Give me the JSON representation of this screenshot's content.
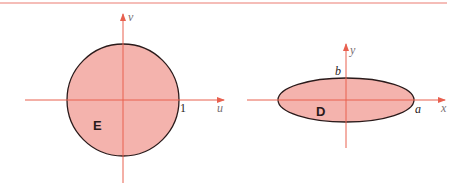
{
  "colors": {
    "axis": "#e8604f",
    "fill": "#f4b3ad",
    "outline": "#2a1a1a",
    "rule": "#f2a7a0",
    "label_gray": "#7a6f73"
  },
  "left_figure": {
    "region_label": "E",
    "x_axis_label": "u",
    "y_axis_label": "v",
    "radius_label": "1",
    "shape": "circle"
  },
  "right_figure": {
    "region_label": "D",
    "x_axis_label": "x",
    "y_axis_label": "y",
    "semi_major_label": "a",
    "semi_minor_label": "b",
    "shape": "ellipse"
  }
}
